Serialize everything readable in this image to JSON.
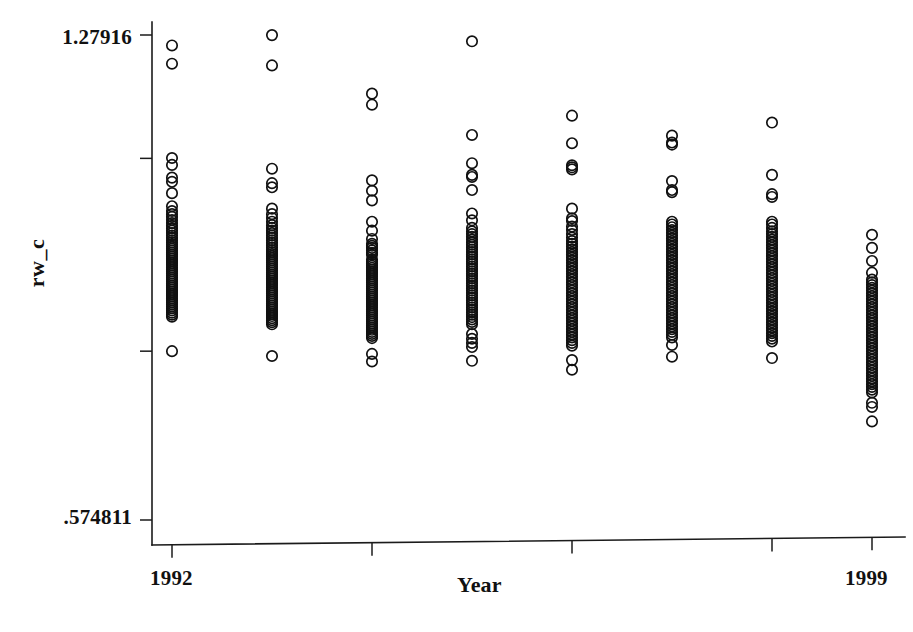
{
  "chart_data": {
    "type": "scatter",
    "title": "",
    "xlabel": "Year",
    "ylabel": "rw_c",
    "grid": false,
    "legend": "none",
    "xlim": [
      1991.5,
      1999.5
    ],
    "ylim": [
      0.574811,
      1.27916
    ],
    "y_tick_labels": [
      "1.27916",
      ".574811"
    ],
    "y_ticks": [
      1.27916,
      1.1,
      0.82,
      0.574811
    ],
    "x_tick_labels": [
      "1992",
      "1999"
    ],
    "x_ticks": [
      1992,
      1994,
      1996,
      1998,
      1999
    ],
    "categories": [
      1992,
      1993,
      1994,
      1995,
      1996,
      1997,
      1998,
      1999
    ],
    "series": [
      {
        "name": "rw_c",
        "marker": "open-circle",
        "color": "#111111",
        "points_by_year": [
          {
            "x": 1992,
            "values": [
              1.264,
              1.2375,
              1.1005,
              1.0905,
              1.072,
              1.066,
              1.0495,
              1.0305,
              1.0235,
              1.019,
              1.015,
              1.0105,
              1.006,
              1.002,
              0.9985,
              0.995,
              0.9915,
              0.988,
              0.9845,
              0.981,
              0.978,
              0.975,
              0.972,
              0.969,
              0.966,
              0.963,
              0.96,
              0.957,
              0.954,
              0.951,
              0.948,
              0.945,
              0.942,
              0.939,
              0.936,
              0.933,
              0.93,
              0.927,
              0.924,
              0.921,
              0.918,
              0.915,
              0.912,
              0.909,
              0.906,
              0.903,
              0.9,
              0.897,
              0.894,
              0.891,
              0.888,
              0.885,
              0.882,
              0.879,
              0.876,
              0.873,
              0.87,
              0.82
            ]
          },
          {
            "x": 1993,
            "values": [
              1.279,
              1.235,
              1.085,
              1.064,
              1.058,
              1.027,
              1.019,
              1.0135,
              1.008,
              1.003,
              0.999,
              0.995,
              0.9915,
              0.988,
              0.9845,
              0.981,
              0.9775,
              0.974,
              0.9705,
              0.967,
              0.964,
              0.961,
              0.958,
              0.955,
              0.952,
              0.949,
              0.946,
              0.943,
              0.94,
              0.937,
              0.934,
              0.931,
              0.928,
              0.925,
              0.922,
              0.919,
              0.916,
              0.913,
              0.91,
              0.907,
              0.904,
              0.901,
              0.898,
              0.895,
              0.892,
              0.889,
              0.886,
              0.883,
              0.88,
              0.877,
              0.874,
              0.871,
              0.868,
              0.865,
              0.862,
              0.859,
              0.813
            ]
          },
          {
            "x": 1994,
            "values": [
              1.194,
              1.178,
              1.068,
              1.053,
              1.039,
              1.008,
              0.995,
              0.983,
              0.976,
              0.973,
              0.97,
              0.9665,
              0.963,
              0.96,
              0.953,
              0.95,
              0.947,
              0.944,
              0.941,
              0.938,
              0.935,
              0.932,
              0.929,
              0.926,
              0.923,
              0.92,
              0.917,
              0.914,
              0.911,
              0.908,
              0.905,
              0.902,
              0.899,
              0.896,
              0.893,
              0.89,
              0.887,
              0.884,
              0.881,
              0.878,
              0.875,
              0.872,
              0.869,
              0.866,
              0.863,
              0.86,
              0.857,
              0.854,
              0.851,
              0.848,
              0.845,
              0.842,
              0.839,
              0.816,
              0.805
            ]
          },
          {
            "x": 1995,
            "values": [
              1.27,
              1.134,
              1.093,
              1.076,
              1.073,
              1.054,
              1.02,
              1.01,
              0.999,
              0.994,
              0.99,
              0.986,
              0.982,
              0.978,
              0.9745,
              0.971,
              0.9675,
              0.964,
              0.9605,
              0.957,
              0.9535,
              0.95,
              0.9465,
              0.943,
              0.9395,
              0.936,
              0.9325,
              0.929,
              0.9255,
              0.922,
              0.9185,
              0.915,
              0.9115,
              0.908,
              0.9045,
              0.901,
              0.8975,
              0.894,
              0.8905,
              0.887,
              0.8835,
              0.88,
              0.8765,
              0.873,
              0.8695,
              0.866,
              0.8625,
              0.859,
              0.845,
              0.838,
              0.832,
              0.826,
              0.806
            ]
          },
          {
            "x": 1996,
            "values": [
              1.162,
              1.122,
              1.09,
              1.087,
              1.084,
              1.027,
              1.013,
              1.009,
              1.001,
              0.996,
              0.99,
              0.985,
              0.98,
              0.976,
              0.972,
              0.968,
              0.964,
              0.96,
              0.956,
              0.952,
              0.948,
              0.944,
              0.94,
              0.936,
              0.932,
              0.928,
              0.924,
              0.92,
              0.916,
              0.912,
              0.908,
              0.904,
              0.9,
              0.896,
              0.892,
              0.888,
              0.884,
              0.88,
              0.876,
              0.872,
              0.868,
              0.864,
              0.86,
              0.856,
              0.852,
              0.848,
              0.844,
              0.84,
              0.836,
              0.832,
              0.828,
              0.807,
              0.793
            ]
          },
          {
            "x": 1997,
            "values": [
              1.133,
              1.123,
              1.12,
              1.067,
              1.054,
              1.051,
              1.008,
              1.004,
              1.0,
              0.996,
              0.992,
              0.988,
              0.984,
              0.98,
              0.976,
              0.972,
              0.968,
              0.964,
              0.96,
              0.956,
              0.952,
              0.948,
              0.944,
              0.94,
              0.936,
              0.932,
              0.928,
              0.924,
              0.92,
              0.916,
              0.912,
              0.908,
              0.904,
              0.9,
              0.896,
              0.892,
              0.888,
              0.884,
              0.88,
              0.876,
              0.872,
              0.868,
              0.864,
              0.86,
              0.856,
              0.852,
              0.848,
              0.844,
              0.84,
              0.829,
              0.812
            ]
          },
          {
            "x": 1998,
            "values": [
              1.152,
              1.076,
              1.048,
              1.044,
              1.008,
              1.004,
              0.999,
              0.994,
              0.99,
              0.986,
              0.982,
              0.978,
              0.974,
              0.97,
              0.966,
              0.962,
              0.958,
              0.954,
              0.95,
              0.946,
              0.942,
              0.938,
              0.934,
              0.93,
              0.926,
              0.922,
              0.918,
              0.914,
              0.91,
              0.906,
              0.902,
              0.898,
              0.894,
              0.89,
              0.886,
              0.882,
              0.878,
              0.874,
              0.87,
              0.866,
              0.862,
              0.858,
              0.854,
              0.85,
              0.846,
              0.842,
              0.838,
              0.834,
              0.81
            ]
          },
          {
            "x": 1999,
            "values": [
              0.989,
              0.97,
              0.951,
              0.934,
              0.924,
              0.92,
              0.916,
              0.912,
              0.908,
              0.904,
              0.9,
              0.896,
              0.892,
              0.888,
              0.884,
              0.88,
              0.876,
              0.872,
              0.868,
              0.864,
              0.86,
              0.856,
              0.852,
              0.848,
              0.844,
              0.84,
              0.836,
              0.832,
              0.828,
              0.824,
              0.82,
              0.816,
              0.812,
              0.808,
              0.804,
              0.8,
              0.796,
              0.792,
              0.788,
              0.784,
              0.78,
              0.776,
              0.772,
              0.768,
              0.764,
              0.76,
              0.745,
              0.739,
              0.718
            ]
          }
        ]
      }
    ]
  },
  "axis": {
    "y_top_label": "1.27916",
    "y_bottom_label": ".574811",
    "x_left_label": "1992",
    "x_right_label": "1999",
    "x_title": "Year",
    "y_title": "rw_c"
  },
  "colors": {
    "ink": "#111111",
    "background": "#ffffff"
  }
}
